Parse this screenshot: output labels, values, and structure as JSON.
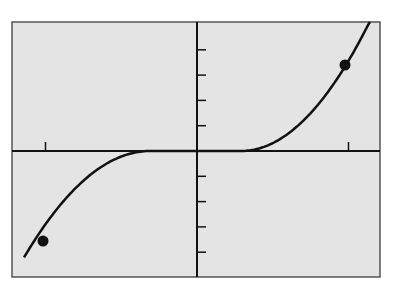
{
  "chart_data": {
    "type": "line",
    "title": "",
    "xlabel": "",
    "ylabel": "",
    "grid": false,
    "legend": null,
    "x_tick_count_each_side": 1,
    "y_tick_count_each_side": 4,
    "x_ticks": [
      -1,
      1
    ],
    "y_ticks": [
      -4,
      -3,
      -2,
      -1,
      1,
      2,
      3,
      4
    ],
    "xlim": [
      -1.02,
      1.21
    ],
    "ylim": [
      -5.0,
      5.15
    ],
    "flat_interval": [
      -0.31,
      0.29
    ],
    "series": [
      {
        "name": "f(x)",
        "points": [
          {
            "x": -1.13,
            "y": -5.0
          },
          {
            "x": -1.0,
            "y": -3.6
          },
          {
            "x": -0.7,
            "y": -1.6
          },
          {
            "x": -0.31,
            "y": 0
          },
          {
            "x": 0,
            "y": 0
          },
          {
            "x": 0.29,
            "y": 0
          },
          {
            "x": 0.7,
            "y": 1.3
          },
          {
            "x": 1.0,
            "y": 3.44
          },
          {
            "x": 1.14,
            "y": 5.15
          }
        ]
      }
    ],
    "highlighted_points": [
      {
        "x": -1.0,
        "y": -3.6
      },
      {
        "x": 1.0,
        "y": 3.44
      }
    ],
    "colors": {
      "background": "#e4e4e4",
      "line": "#111111",
      "frame": "#555555"
    }
  }
}
